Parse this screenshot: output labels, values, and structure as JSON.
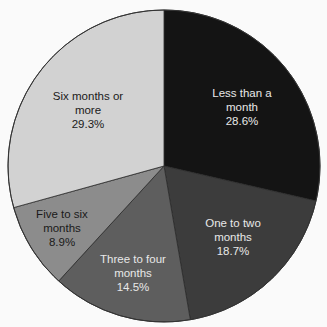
{
  "chart_data": {
    "type": "pie",
    "title": "",
    "start_angle": "12 o'clock, clockwise",
    "categories": [
      "Less than a month",
      "One to two months",
      "Three to four months",
      "Five to six months",
      "Six months or more"
    ],
    "values": [
      28.6,
      18.7,
      14.5,
      8.9,
      29.3
    ],
    "value_labels": [
      "28.6%",
      "18.7%",
      "14.5%",
      "8.9%",
      "29.3%"
    ],
    "colors": [
      "#141414",
      "#3c3c3c",
      "#5e5e5e",
      "#8c8c8c",
      "#d2d2d2"
    ],
    "label_colors": [
      "#e8e8e8",
      "#e8e8e8",
      "#e8e8e8",
      "#1a1a1a",
      "#1a1a1a"
    ],
    "legend": "none (labels inside slices)"
  },
  "labels": [
    {
      "line1": "Less than a",
      "line2": "month",
      "value": "28.6%"
    },
    {
      "line1": "One to two",
      "line2": "months",
      "value": "18.7%"
    },
    {
      "line1": "Three to four",
      "line2": "months",
      "value": "14.5%"
    },
    {
      "line1": "Five to six",
      "line2": "months",
      "value": "8.9%"
    },
    {
      "line1": "Six months or",
      "line2": "more",
      "value": "29.3%"
    }
  ]
}
